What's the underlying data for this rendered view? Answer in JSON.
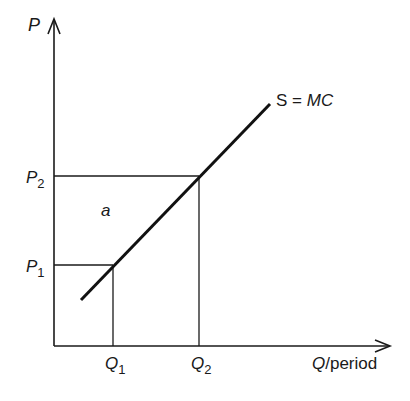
{
  "diagram": {
    "type": "supply-curve",
    "y_axis": {
      "label": "P"
    },
    "x_axis": {
      "label_var": "Q",
      "label_suffix": "/period"
    },
    "curve": {
      "label_prefix": "S = ",
      "label_var": "MC"
    },
    "price_levels": [
      {
        "base": "P",
        "sub": "1"
      },
      {
        "base": "P",
        "sub": "2"
      }
    ],
    "quantity_levels": [
      {
        "base": "Q",
        "sub": "1"
      },
      {
        "base": "Q",
        "sub": "2"
      }
    ],
    "region_label": "a",
    "colors": {
      "ink": "#1a1a1a",
      "background": "#ffffff"
    }
  }
}
